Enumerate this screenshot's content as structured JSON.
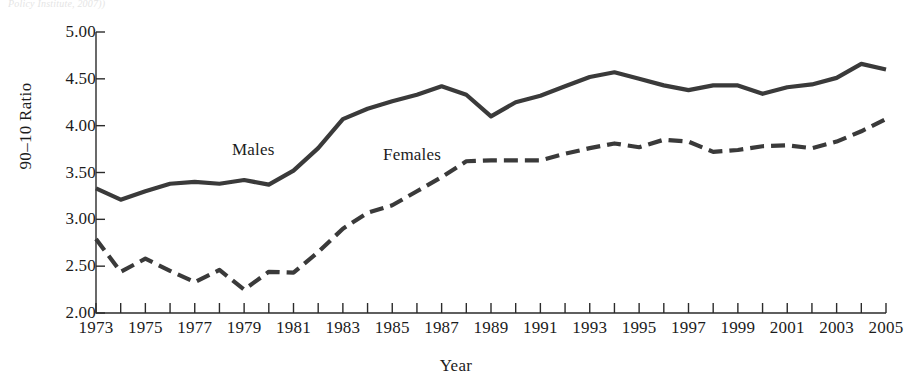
{
  "figure": {
    "partial_header_text": "Policy Institute, 2007))",
    "line_color": "#3a3a3a",
    "axis_color": "#2b2b2b"
  },
  "chart_data": {
    "type": "line",
    "title": "",
    "xlabel": "Year",
    "ylabel": "90–10 Ratio",
    "xlim": [
      1973,
      2005
    ],
    "ylim": [
      2.0,
      5.0
    ],
    "ytick_step": 0.5,
    "grid": false,
    "legend_position": "inline-annotation",
    "ytick_labels": [
      "2.00",
      "2.50",
      "3.00",
      "3.50",
      "4.00",
      "4.50",
      "5.00"
    ],
    "ytick_values": [
      2.0,
      2.5,
      3.0,
      3.5,
      4.0,
      4.5,
      5.0
    ],
    "xtick_values": [
      1973,
      1974,
      1975,
      1976,
      1977,
      1978,
      1979,
      1980,
      1981,
      1982,
      1983,
      1984,
      1985,
      1986,
      1987,
      1988,
      1989,
      1990,
      1991,
      1992,
      1993,
      1994,
      1995,
      1996,
      1997,
      1998,
      1999,
      2000,
      2001,
      2002,
      2003,
      2004,
      2005
    ],
    "xtick_labels_shown": [
      "1973",
      "1975",
      "1977",
      "1979",
      "1981",
      "1983",
      "1985",
      "1987",
      "1989",
      "1991",
      "1993",
      "1995",
      "1997",
      "1999",
      "2001",
      "2003",
      "2005"
    ],
    "x": [
      1973,
      1974,
      1975,
      1976,
      1977,
      1978,
      1979,
      1980,
      1981,
      1982,
      1983,
      1984,
      1985,
      1986,
      1987,
      1988,
      1989,
      1990,
      1991,
      1992,
      1993,
      1994,
      1995,
      1996,
      1997,
      1998,
      1999,
      2000,
      2001,
      2002,
      2003,
      2004,
      2005
    ],
    "series": [
      {
        "name": "Males",
        "style": "solid",
        "label": "Males",
        "values": [
          3.33,
          3.21,
          3.3,
          3.38,
          3.4,
          3.38,
          3.42,
          3.37,
          3.52,
          3.76,
          4.07,
          4.18,
          4.26,
          4.33,
          4.42,
          4.33,
          4.1,
          4.25,
          4.32,
          4.42,
          4.52,
          4.57,
          4.5,
          4.43,
          4.38,
          4.43,
          4.43,
          4.34,
          4.41,
          4.44,
          4.51,
          4.66,
          4.6
        ]
      },
      {
        "name": "Females",
        "style": "dashed",
        "label": "Females",
        "values": [
          2.79,
          2.44,
          2.58,
          2.45,
          2.33,
          2.46,
          2.25,
          2.44,
          2.43,
          2.65,
          2.9,
          3.07,
          3.15,
          3.3,
          3.45,
          3.62,
          3.63,
          3.63,
          3.63,
          3.7,
          3.76,
          3.81,
          3.77,
          3.85,
          3.83,
          3.72,
          3.74,
          3.78,
          3.79,
          3.76,
          3.83,
          3.94,
          4.07
        ]
      }
    ]
  }
}
